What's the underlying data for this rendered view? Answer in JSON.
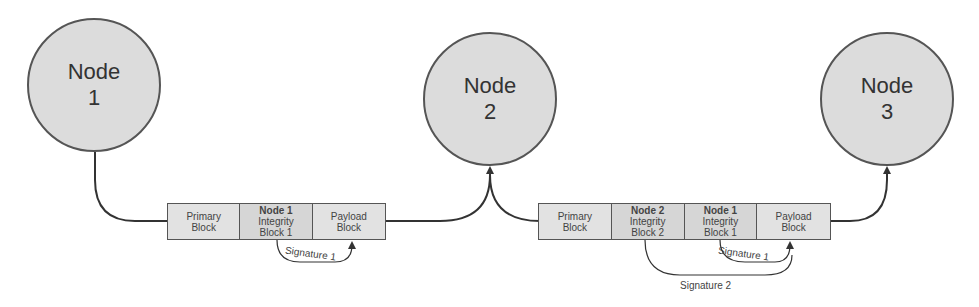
{
  "diagram": {
    "nodes": [
      {
        "id": "node1",
        "label": "Node",
        "number": "1"
      },
      {
        "id": "node2",
        "label": "Node",
        "number": "2"
      },
      {
        "id": "node3",
        "label": "Node",
        "number": "3"
      }
    ],
    "bundle1": {
      "cells": [
        {
          "line1": "",
          "line2": "Primary",
          "line3": "Block"
        },
        {
          "line1": "Node 1",
          "line2": "Integrity",
          "line3": "Block 1"
        },
        {
          "line1": "",
          "line2": "Payload",
          "line3": "Block"
        }
      ],
      "signatures": [
        "Signature 1"
      ]
    },
    "bundle2": {
      "cells": [
        {
          "line1": "",
          "line2": "Primary",
          "line3": "Block"
        },
        {
          "line1": "Node 2",
          "line2": "Integrity",
          "line3": "Block 2"
        },
        {
          "line1": "Node 1",
          "line2": "Integrity",
          "line3": "Block 1"
        },
        {
          "line1": "",
          "line2": "Payload",
          "line3": "Block"
        }
      ],
      "signatures": [
        "Signature 1",
        "Signature 2"
      ]
    },
    "colors": {
      "node_fill": "#dcdcdc",
      "block_fill": "#e2e2e2",
      "stroke": "#444444"
    }
  }
}
